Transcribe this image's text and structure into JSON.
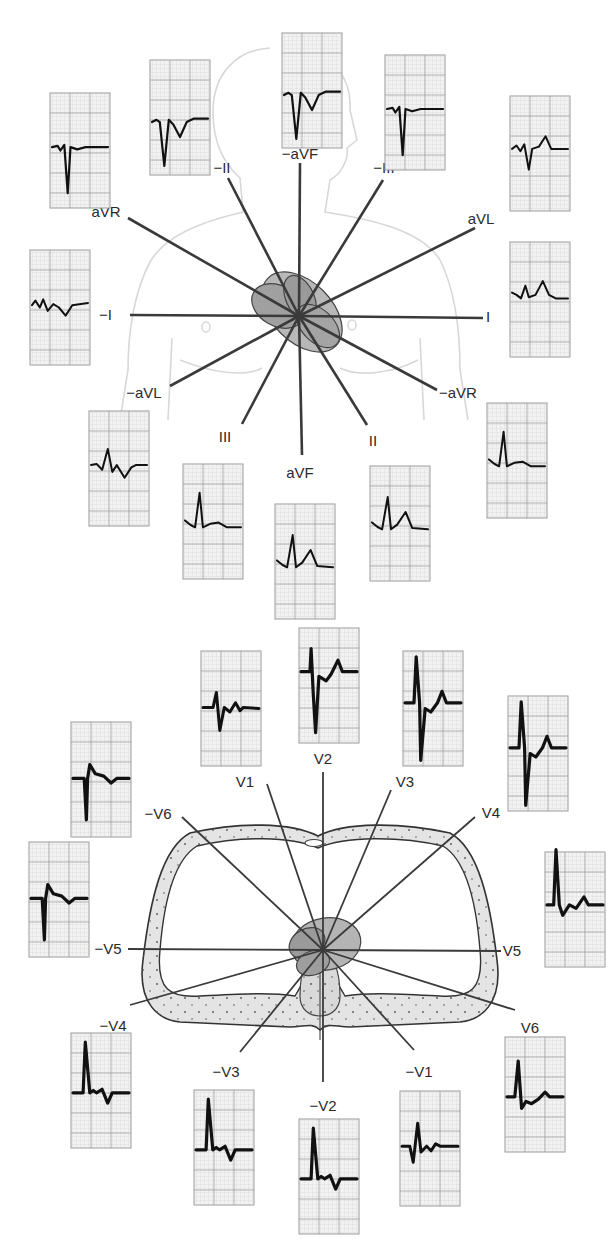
{
  "figure": {
    "title": "",
    "panels": [
      {
        "id": "frontal",
        "name": "Frontal plane (limb) leads — hexaxial reference system",
        "center": [
          299,
          316
        ],
        "leads": [
          {
            "label": "I",
            "end": [
              483,
              318
            ],
            "label_pos": [
              486,
              322
            ],
            "anchor": "start"
          },
          {
            "label": "-I",
            "end": [
              130,
              315
            ],
            "label_pos": [
              112,
              320
            ],
            "anchor": "end"
          },
          {
            "label": "aVL",
            "end": [
              475,
              228
            ],
            "label_pos": [
              481,
              224
            ],
            "anchor": "middle"
          },
          {
            "label": "-aVL",
            "end": [
              170,
              386
            ],
            "label_pos": [
              144,
              398
            ],
            "anchor": "middle"
          },
          {
            "label": "aVR",
            "end": [
              128,
              218
            ],
            "label_pos": [
              106,
              217
            ],
            "anchor": "middle"
          },
          {
            "label": "-aVR",
            "end": [
              437,
              390
            ],
            "label_pos": [
              458,
              398
            ],
            "anchor": "middle"
          },
          {
            "label": "-aVF",
            "end": [
              300,
              163
            ],
            "label_pos": [
              300,
              159
            ],
            "anchor": "middle"
          },
          {
            "label": "aVF",
            "end": [
              302,
              455
            ],
            "label_pos": [
              300,
              478
            ],
            "anchor": "middle"
          },
          {
            "label": "-II",
            "end": [
              228,
              178
            ],
            "label_pos": [
              222,
              173
            ],
            "anchor": "middle"
          },
          {
            "label": "II",
            "end": [
              367,
              425
            ],
            "label_pos": [
              373,
              446
            ],
            "anchor": "middle"
          },
          {
            "label": "-III",
            "end": [
              383,
              180
            ],
            "label_pos": [
              384,
              173
            ],
            "anchor": "middle"
          },
          {
            "label": "III",
            "end": [
              242,
              424
            ],
            "label_pos": [
              225,
              442
            ],
            "anchor": "middle"
          }
        ],
        "ecg_strips": [
          {
            "lead": "aVR",
            "x": 50,
            "y": 93,
            "w": 60,
            "h": 115,
            "trace": "negQS"
          },
          {
            "lead": "-II",
            "x": 150,
            "y": 60,
            "w": 60,
            "h": 115,
            "trace": "negQS_T"
          },
          {
            "lead": "-aVF",
            "x": 282,
            "y": 33,
            "w": 60,
            "h": 115,
            "trace": "negQS_T"
          },
          {
            "lead": "-III",
            "x": 385,
            "y": 55,
            "w": 60,
            "h": 115,
            "trace": "negQS"
          },
          {
            "lead": "aVL",
            "x": 510,
            "y": 96,
            "w": 60,
            "h": 115,
            "trace": "rS_T"
          },
          {
            "lead": "-I",
            "x": 30,
            "y": 250,
            "w": 60,
            "h": 115,
            "trace": "smallneg"
          },
          {
            "lead": "I",
            "x": 510,
            "y": 242,
            "w": 60,
            "h": 115,
            "trace": "smallpos_T"
          },
          {
            "lead": "-aVL",
            "x": 89,
            "y": 411,
            "w": 60,
            "h": 115,
            "trace": "biphasic"
          },
          {
            "lead": "-aVR",
            "x": 487,
            "y": 403,
            "w": 60,
            "h": 115,
            "trace": "posR_flat"
          },
          {
            "lead": "III",
            "x": 183,
            "y": 464,
            "w": 60,
            "h": 115,
            "trace": "posR_flat"
          },
          {
            "lead": "aVF",
            "x": 275,
            "y": 504,
            "w": 60,
            "h": 115,
            "trace": "posR_T"
          },
          {
            "lead": "II",
            "x": 370,
            "y": 466,
            "w": 60,
            "h": 115,
            "trace": "posR_T"
          }
        ]
      },
      {
        "id": "horizontal",
        "name": "Horizontal plane (precordial) leads — chest cross-section",
        "center": [
          323,
          950
        ],
        "leads": [
          {
            "label": "V1",
            "end": [
              267,
              784
            ],
            "label_pos": [
              245,
              787
            ],
            "anchor": "middle"
          },
          {
            "label": "-V1",
            "end": [
              414,
              1050
            ],
            "label_pos": [
              419,
              1077
            ],
            "anchor": "middle"
          },
          {
            "label": "V2",
            "end": [
              323,
              772
            ],
            "label_pos": [
              323,
              764
            ],
            "anchor": "middle"
          },
          {
            "label": "-V2",
            "end": [
              323,
              1082
            ],
            "label_pos": [
              323,
              1111
            ],
            "anchor": "middle"
          },
          {
            "label": "V3",
            "end": [
              391,
              790
            ],
            "label_pos": [
              405,
              787
            ],
            "anchor": "middle"
          },
          {
            "label": "-V3",
            "end": [
              240,
              1052
            ],
            "label_pos": [
              226,
              1077
            ],
            "anchor": "middle"
          },
          {
            "label": "V4",
            "end": [
              475,
              817
            ],
            "label_pos": [
              491,
              818
            ],
            "anchor": "middle"
          },
          {
            "label": "-V4",
            "end": [
              130,
              1005
            ],
            "label_pos": [
              113,
              1031
            ],
            "anchor": "middle"
          },
          {
            "label": "V5",
            "end": [
              501,
              951
            ],
            "label_pos": [
              512,
              956
            ],
            "anchor": "middle"
          },
          {
            "label": "-V5",
            "end": [
              128,
              949
            ],
            "label_pos": [
              108,
              954
            ],
            "anchor": "middle"
          },
          {
            "label": "V6",
            "end": [
              515,
              1010
            ],
            "label_pos": [
              530,
              1033
            ],
            "anchor": "middle"
          },
          {
            "label": "-V6",
            "end": [
              182,
              817
            ],
            "label_pos": [
              158,
              819
            ],
            "anchor": "middle"
          }
        ],
        "ecg_strips": [
          {
            "lead": "-V6",
            "x": 71,
            "y": 722,
            "w": 60,
            "h": 115,
            "trace": "QS_small"
          },
          {
            "lead": "V1",
            "x": 201,
            "y": 651,
            "w": 60,
            "h": 115,
            "trace": "rS_small"
          },
          {
            "lead": "V2",
            "x": 299,
            "y": 628,
            "w": 60,
            "h": 115,
            "trace": "deepS_T"
          },
          {
            "lead": "V3",
            "x": 403,
            "y": 651,
            "w": 60,
            "h": 115,
            "trace": "RS_T"
          },
          {
            "lead": "V4",
            "x": 508,
            "y": 696,
            "w": 60,
            "h": 115,
            "trace": "RS_T"
          },
          {
            "lead": "-V5",
            "x": 29,
            "y": 842,
            "w": 60,
            "h": 115,
            "trace": "QS_small"
          },
          {
            "lead": "V5",
            "x": 545,
            "y": 852,
            "w": 60,
            "h": 115,
            "trace": "tallR_T"
          },
          {
            "lead": "-V4",
            "x": 71,
            "y": 1033,
            "w": 60,
            "h": 115,
            "trace": "Rs_invT"
          },
          {
            "lead": "-V3",
            "x": 194,
            "y": 1090,
            "w": 60,
            "h": 115,
            "trace": "Rs_invT"
          },
          {
            "lead": "-V2",
            "x": 299,
            "y": 1119,
            "w": 60,
            "h": 115,
            "trace": "Rs_invT"
          },
          {
            "lead": "-V1",
            "x": 400,
            "y": 1091,
            "w": 60,
            "h": 115,
            "trace": "qr_small"
          },
          {
            "lead": "V6",
            "x": 505,
            "y": 1037,
            "w": 60,
            "h": 115,
            "trace": "tallR_small"
          }
        ]
      }
    ]
  },
  "colors": {
    "background": "#ffffff",
    "grid_minor": "#c9c9c9",
    "grid_major": "#9a9a9a",
    "strip_bg": "#f2f2f2",
    "trace": "#111111",
    "ray": "#3a3a3a",
    "label": "#2a2a2a",
    "body_outline": "#d6d6d6",
    "heart_fill": "#a8a8a8",
    "heart_dark": "#8c8c8c",
    "chest_fill": "#e6e6e6"
  }
}
